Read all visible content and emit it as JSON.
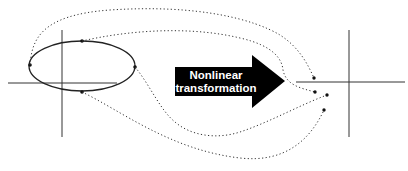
{
  "diagram": {
    "arrow_label_line1": "Nonlinear",
    "arrow_label_line2": "transformation",
    "colors": {
      "background": "#ffffff",
      "stroke": "#222222",
      "arrow_fill": "#000000",
      "arrow_text": "#ffffff",
      "dotted_path": "#333333"
    },
    "left_plot": {
      "axes": {
        "x_axis_y": 83,
        "x_from": 8,
        "x_to": 117,
        "y_axis_x": 62,
        "y_from": 30,
        "y_to": 137
      },
      "ellipse": {
        "cx": 82,
        "cy": 66,
        "rx": 53,
        "ry": 25
      },
      "points": [
        {
          "name": "left",
          "x": 30,
          "y": 65
        },
        {
          "name": "top",
          "x": 82,
          "y": 41
        },
        {
          "name": "right",
          "x": 135,
          "y": 67
        },
        {
          "name": "bottom",
          "x": 82,
          "y": 92
        }
      ]
    },
    "right_plot": {
      "axes": {
        "x_axis_y": 82,
        "x_from": 296,
        "x_to": 405,
        "y_axis_x": 349,
        "y_from": 30,
        "y_to": 137
      },
      "mapped_points": [
        {
          "name": "left-mapped",
          "x": 314,
          "y": 78
        },
        {
          "name": "top-mapped",
          "x": 315,
          "y": 92
        },
        {
          "name": "right-mapped",
          "x": 327,
          "y": 95
        },
        {
          "name": "bottom-mapped",
          "x": 324,
          "y": 110
        }
      ]
    }
  }
}
